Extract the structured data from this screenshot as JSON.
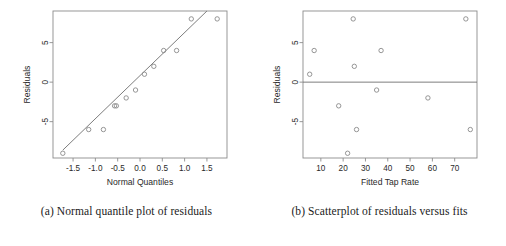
{
  "figure": {
    "panels": [
      {
        "id": "panel-a",
        "caption": "(a)  Normal quantile plot of residuals",
        "chart_data": {
          "type": "scatter",
          "title": "",
          "xlabel": "Normal Quantiles",
          "ylabel": "Residuals",
          "xlim": [
            -1.95,
            1.95
          ],
          "ylim": [
            -9.6,
            9.0
          ],
          "xticks": [
            -1.5,
            -1.0,
            -0.5,
            0.0,
            0.5,
            1.0,
            1.5
          ],
          "xticklabels": [
            "-1.5",
            "-1.0",
            "-0.5",
            "0.0",
            "0.5",
            "1.0",
            "1.5"
          ],
          "yticks": [
            -5,
            0,
            5
          ],
          "yticklabels": [
            "-5",
            "0",
            "5"
          ],
          "grid": false,
          "legend": false,
          "points": [
            {
              "x": -1.73,
              "y": -9.0
            },
            {
              "x": -1.15,
              "y": -6.0
            },
            {
              "x": -0.82,
              "y": -6.0
            },
            {
              "x": -0.57,
              "y": -3.0
            },
            {
              "x": -0.53,
              "y": -3.0
            },
            {
              "x": -0.31,
              "y": -2.0
            },
            {
              "x": -0.1,
              "y": -1.0
            },
            {
              "x": 0.1,
              "y": 1.0
            },
            {
              "x": 0.31,
              "y": 2.0
            },
            {
              "x": 0.53,
              "y": 4.0
            },
            {
              "x": 0.82,
              "y": 4.0
            },
            {
              "x": 1.15,
              "y": 8.0
            },
            {
              "x": 1.73,
              "y": 8.0
            }
          ],
          "reference_line": {
            "x0": -1.73,
            "y0": -8.6,
            "x1": 1.5,
            "y1": 9.0
          }
        }
      },
      {
        "id": "panel-b",
        "caption": "(b)  Scatterplot of residuals versus fits",
        "chart_data": {
          "type": "scatter",
          "title": "",
          "xlabel": "Fitted Tap Rate",
          "ylabel": "Residuals",
          "xlim": [
            2,
            80
          ],
          "ylim": [
            -9.6,
            9.0
          ],
          "xticks": [
            10,
            20,
            30,
            40,
            50,
            60,
            70
          ],
          "xticklabels": [
            "10",
            "20",
            "30",
            "40",
            "50",
            "60",
            "70"
          ],
          "yticks": [
            -5,
            0,
            5
          ],
          "yticklabels": [
            "-5",
            "0",
            "5"
          ],
          "grid": false,
          "legend": false,
          "zero_line": 0,
          "points": [
            {
              "x": 5.0,
              "y": 1.0
            },
            {
              "x": 7.0,
              "y": 4.0
            },
            {
              "x": 18.0,
              "y": -3.0
            },
            {
              "x": 22.0,
              "y": -9.0
            },
            {
              "x": 24.5,
              "y": 8.0
            },
            {
              "x": 25.0,
              "y": 2.0
            },
            {
              "x": 26.0,
              "y": -6.0
            },
            {
              "x": 35.0,
              "y": -1.0
            },
            {
              "x": 37.0,
              "y": 4.0
            },
            {
              "x": 58.0,
              "y": -2.0
            },
            {
              "x": 75.0,
              "y": 8.0
            },
            {
              "x": 77.0,
              "y": -6.0
            }
          ]
        }
      }
    ]
  }
}
